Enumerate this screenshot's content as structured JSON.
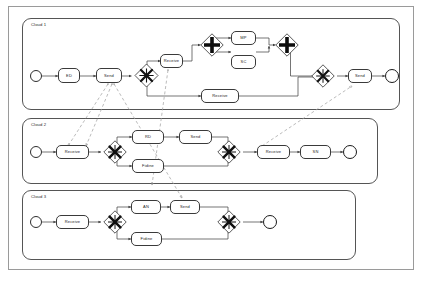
{
  "diagram": {
    "type": "bpmn-collaboration",
    "colors": {
      "frame_border": "#9a9a9a",
      "pool_border": "#555555",
      "shape_stroke": "#3a3a3a",
      "flow_stroke": "#4a4a4a",
      "message_stroke": "#9e9e9e",
      "background": "#ffffff",
      "text": "#1c1c1c"
    },
    "pools": [
      {
        "id": "pool1",
        "label": "Cloud 1",
        "elements": {
          "start_event": {
            "name": "start-event",
            "label": ""
          },
          "tasks": [
            {
              "id": "p1-ed",
              "label": "ED"
            },
            {
              "id": "p1-send1",
              "label": "Send"
            },
            {
              "id": "p1-receive1",
              "label": "Receive"
            },
            {
              "id": "p1-mp",
              "label": "MP"
            },
            {
              "id": "p1-sc",
              "label": "SC"
            },
            {
              "id": "p1-receive2",
              "label": "Receive"
            },
            {
              "id": "p1-send2",
              "label": "Send"
            }
          ],
          "gateways": [
            {
              "id": "p1-gw1",
              "kind": "complex"
            },
            {
              "id": "p1-gw2",
              "kind": "parallel"
            },
            {
              "id": "p1-gw3",
              "kind": "parallel"
            },
            {
              "id": "p1-gw4",
              "kind": "complex"
            }
          ],
          "end_event": {
            "name": "end-event",
            "label": ""
          }
        }
      },
      {
        "id": "pool2",
        "label": "Cloud 2",
        "elements": {
          "start_event": {
            "name": "start-event",
            "label": ""
          },
          "tasks": [
            {
              "id": "p2-receive1",
              "label": "Receive"
            },
            {
              "id": "p2-rd",
              "label": "RD"
            },
            {
              "id": "p2-fidine",
              "label": "Fidine"
            },
            {
              "id": "p2-send",
              "label": "Send"
            },
            {
              "id": "p2-receive2",
              "label": "Receive"
            },
            {
              "id": "p2-sn",
              "label": "SN"
            }
          ],
          "gateways": [
            {
              "id": "p2-gw1",
              "kind": "complex"
            },
            {
              "id": "p2-gw2",
              "kind": "complex"
            }
          ],
          "end_event": {
            "name": "end-event",
            "label": ""
          }
        }
      },
      {
        "id": "pool3",
        "label": "Cloud 3",
        "elements": {
          "start_event": {
            "name": "start-event",
            "label": ""
          },
          "tasks": [
            {
              "id": "p3-receive",
              "label": "Receive"
            },
            {
              "id": "p3-an",
              "label": "AN"
            },
            {
              "id": "p3-send",
              "label": "Send"
            },
            {
              "id": "p3-fidine",
              "label": "Fidine"
            }
          ],
          "gateways": [
            {
              "id": "p3-gw1",
              "kind": "complex"
            },
            {
              "id": "p3-gw2",
              "kind": "complex"
            }
          ],
          "end_event": {
            "name": "end-event",
            "label": ""
          }
        }
      }
    ]
  }
}
